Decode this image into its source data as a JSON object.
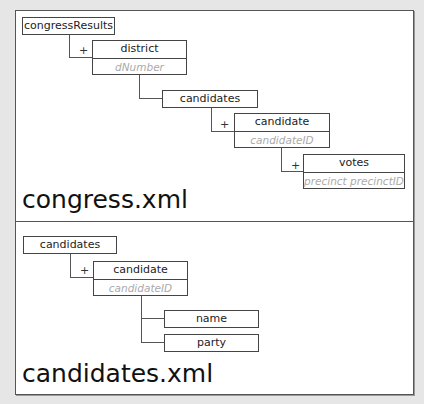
{
  "diagrams": [
    {
      "file_label": "congress.xml",
      "nodes": [
        {
          "name": "congressResults"
        },
        {
          "name": "district",
          "attribute": "dNumber",
          "repeat": "+"
        },
        {
          "name": "candidates"
        },
        {
          "name": "candidate",
          "attribute": "candidateID",
          "repeat": "+"
        },
        {
          "name": "votes",
          "attribute": "precinct precinctID",
          "repeat": "+"
        }
      ]
    },
    {
      "file_label": "candidates.xml",
      "nodes": [
        {
          "name": "candidates"
        },
        {
          "name": "candidate",
          "attribute": "candidateID",
          "repeat": "+"
        },
        {
          "name": "name"
        },
        {
          "name": "party"
        }
      ]
    }
  ],
  "colors": {
    "border": "#444444",
    "attribute_text": "#aaaaaa",
    "background": "#e6e6e6",
    "panel": "#ffffff"
  }
}
